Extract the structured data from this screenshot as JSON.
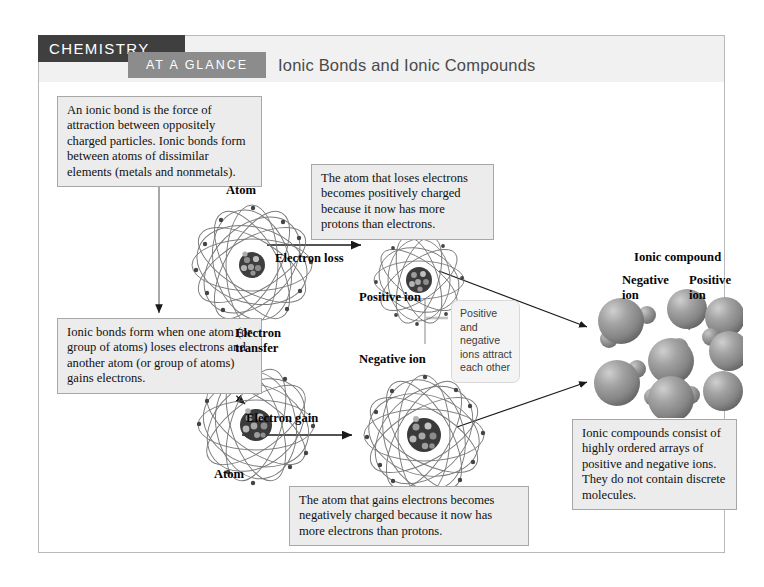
{
  "header": {
    "brand": "CHEMISTRY",
    "subtitle": "AT A GLANCE",
    "title": "Ionic Bonds and Ionic Compounds"
  },
  "colors": {
    "brand_bar": "#3f3f3f",
    "subtitle_bar": "#8c8c8c",
    "header_strip": "#f1f1f1",
    "textbox_fill": "#ececec",
    "textbox_border": "#a7a7a7",
    "callout_fill": "#f4f4f4",
    "frame_border": "#b9b9b9",
    "sphere_gray": "#8e8e8e",
    "orbit_gray": "#6f6f6f"
  },
  "boxes": {
    "definition": "An ionic bond is the force of attraction between oppositely charged particles. Ionic bonds form between atoms of dissimilar elements (metals and nonmetals).",
    "formation": "Ionic bonds form when one atom (or group of atoms) loses electrons and another atom (or group of atoms) gains electrons.",
    "loses_electrons": "The atom that loses electrons becomes positively charged because it now has more protons than electrons.",
    "gains_electrons": "The atom that gains electrons becomes negatively charged because it now has more electrons than protons.",
    "arrays": "Ionic compounds consist of highly ordered arrays of positive and negative ions. They do not contain discrete molecules.",
    "attract_callout": "Positive and negative ions attract each other"
  },
  "labels": {
    "atom_top": "Atom",
    "atom_bottom": "Atom",
    "positive_ion": "Positive ion",
    "negative_ion": "Negative ion",
    "electron_loss": "Electron loss",
    "electron_gain": "Electron gain",
    "electron_transfer": "Electron transfer",
    "ionic_compound": "Ionic compound",
    "crystal_negative_ion": "Negative ion",
    "crystal_positive_ion": "Positive ion"
  }
}
